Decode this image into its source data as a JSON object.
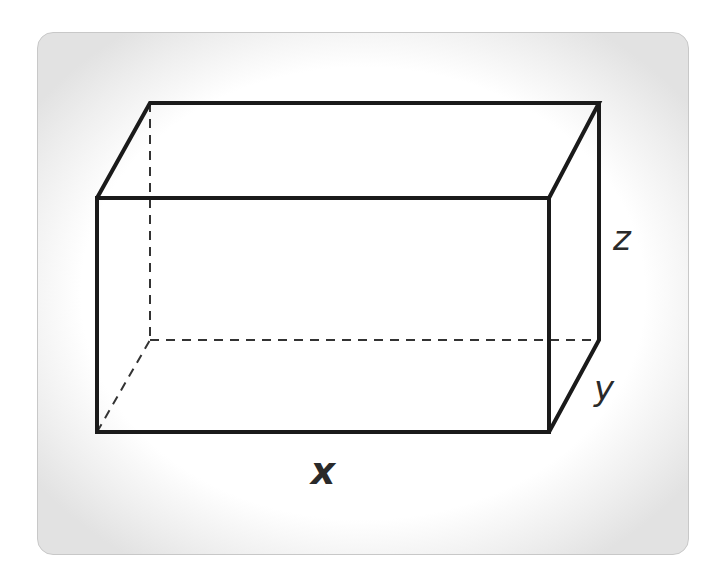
{
  "diagram": {
    "type": "rectangular-prism",
    "labels": {
      "x": "x",
      "y": "y",
      "z": "z"
    },
    "colors": {
      "edge": "#1a1a1a",
      "hidden_edge": "#333333",
      "label": "#2a2a2a"
    }
  }
}
